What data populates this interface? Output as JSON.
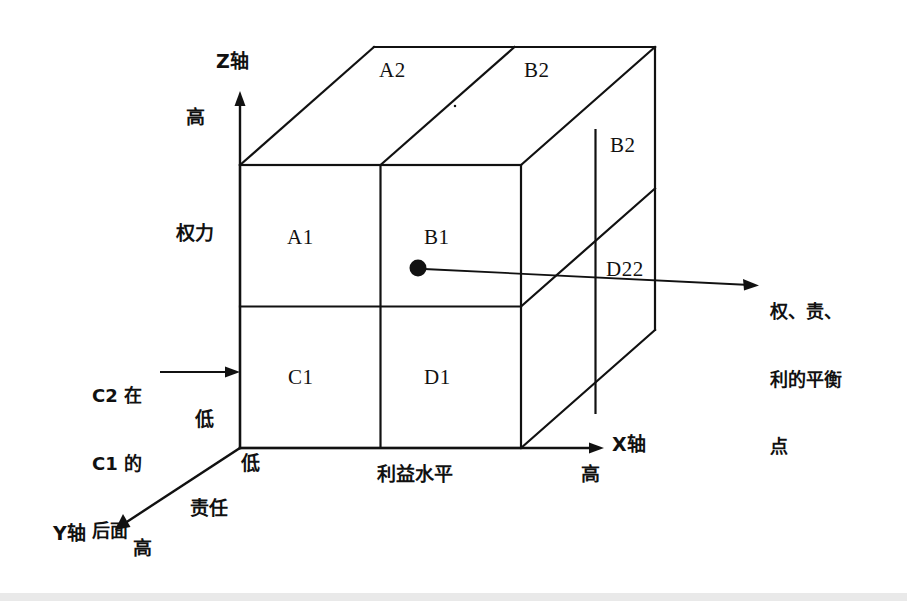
{
  "figure": {
    "kind": "3d-cube-matrix-diagram",
    "background_color": "#ffffff",
    "line_color": "#111111",
    "canvas": {
      "width": 907,
      "height": 601
    }
  },
  "axes": {
    "z": {
      "name": "Z轴",
      "quantity": "权力",
      "high_label": "高",
      "low_label": "低"
    },
    "x": {
      "name": "X轴",
      "quantity": "利益水平",
      "high_label": "高",
      "low_label": "低"
    },
    "y": {
      "name": "Y轴",
      "quantity": "责任",
      "high_label": "高"
    }
  },
  "cells": {
    "front_face": [
      {
        "id": "A1",
        "label": "A1",
        "row": "upper",
        "col": "left"
      },
      {
        "id": "B1",
        "label": "B1",
        "row": "upper",
        "col": "right"
      },
      {
        "id": "C1",
        "label": "C1",
        "row": "lower",
        "col": "left"
      },
      {
        "id": "D1",
        "label": "D1",
        "row": "lower",
        "col": "right"
      }
    ],
    "top_face": [
      {
        "id": "A2",
        "label": "A2",
        "col": "left"
      },
      {
        "id": "B2-top",
        "label": "B2",
        "col": "right"
      }
    ],
    "right_face": [
      {
        "id": "B2-side",
        "label": "B2",
        "row": "upper"
      },
      {
        "id": "D22-side",
        "label": "D22",
        "row": "lower"
      }
    ]
  },
  "annotations": {
    "hidden_cell_note": "C2 在\nC1 的\n后面",
    "hidden_cell_note_lines": [
      "C2 在",
      "C1 的",
      "后面"
    ],
    "balance_point": "权、责、\n利的平衡\n点",
    "balance_point_lines": [
      "权、责、",
      "利的平衡",
      "点"
    ]
  },
  "marker": {
    "name": "balance-point-dot",
    "x": 418,
    "y": 268,
    "radius": 8,
    "color": "#111111"
  }
}
